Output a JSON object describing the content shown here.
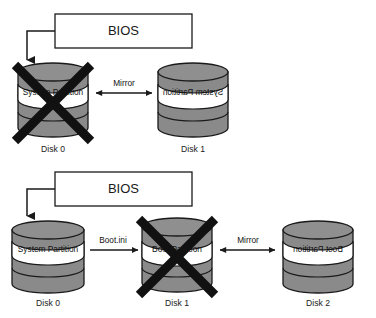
{
  "diagram": {
    "background_color": "#ffffff",
    "cylinder_fill": "#8a8a8a",
    "cylinder_top_fill": "#8f8f8f",
    "band_fill": "#ffffff",
    "stroke_color": "#1a1a1a",
    "x_mark_color": "#111111"
  },
  "scenarios": [
    {
      "name": "two-disk-mirror",
      "bios": {
        "label": "BIOS"
      },
      "disks": [
        {
          "id": "top-disk-0",
          "caption": "Disk 0",
          "partition_label": "System Partition",
          "mirrored": false,
          "failed": true
        },
        {
          "id": "top-disk-1",
          "caption": "Disk 1",
          "partition_label": "System Partition",
          "mirrored": true,
          "failed": false
        }
      ],
      "connections": [
        {
          "name": "mirror-link",
          "label": "Mirror",
          "arrow": "double"
        }
      ]
    },
    {
      "name": "three-disk-mirror",
      "bios": {
        "label": "BIOS"
      },
      "disks": [
        {
          "id": "bottom-disk-0",
          "caption": "Disk 0",
          "partition_label": "System Partition",
          "mirrored": false,
          "failed": false
        },
        {
          "id": "bottom-disk-1",
          "caption": "Disk 1",
          "partition_label": "Boot Partition",
          "mirrored": false,
          "failed": true
        },
        {
          "id": "bottom-disk-2",
          "caption": "Boot Partition",
          "partition_label": "Boot Partition",
          "mirrored": true,
          "failed": false
        }
      ],
      "captions": {
        "disk0": "Disk 0",
        "disk1": "Disk 1",
        "disk2": "Disk 2"
      },
      "connections": [
        {
          "name": "bootini-link",
          "label": "Boot.ini",
          "arrow": "single"
        },
        {
          "name": "mirror-link",
          "label": "Mirror",
          "arrow": "double"
        }
      ]
    }
  ],
  "labels": {
    "bios_top": "BIOS",
    "bios_bottom": "BIOS",
    "top_disk0_partition": "System Partition",
    "top_disk1_partition": "System Partition",
    "top_disk0_caption": "Disk 0",
    "top_disk1_caption": "Disk 1",
    "top_mirror": "Mirror",
    "bot_disk0_partition": "System Partition",
    "bot_disk1_partition": "Boot Partition",
    "bot_disk2_partition": "Boot Partition",
    "bot_disk0_caption": "Disk 0",
    "bot_disk1_caption": "Disk 1",
    "bot_disk2_caption": "Disk 2",
    "bot_bootini": "Boot.ini",
    "bot_mirror": "Mirror"
  }
}
